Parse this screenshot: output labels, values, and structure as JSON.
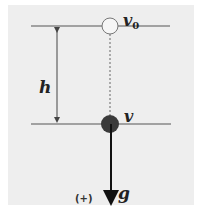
{
  "diagram": {
    "type": "free-fall",
    "labels": {
      "initial_velocity": "v",
      "initial_velocity_subscript": "0",
      "final_velocity": "v",
      "height": "h",
      "gravity": "g",
      "positive_direction": "(+)"
    },
    "colors": {
      "background": "#eeeeee",
      "lines": "#555555",
      "ball_filled": "#3a3a3a",
      "ball_outline": "#777777",
      "text": "#222222"
    }
  }
}
